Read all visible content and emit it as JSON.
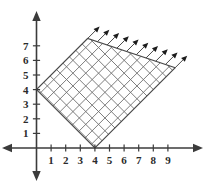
{
  "figure": {
    "kind": "coordinate-graph",
    "background_color": "#ffffff",
    "axis_color": "#3b3b3b",
    "label_color": "#2b2b2b",
    "region_border_color": "#4a4a4a",
    "hatch_color": "#6e6e6e",
    "arrow_color": "#1c1c1c"
  },
  "chart_data": {
    "type": "scatter",
    "title": "",
    "subtitle": "",
    "xlabel": "",
    "ylabel": "",
    "grid": false,
    "legend": "none",
    "xlim": [
      -1,
      10.5
    ],
    "ylim": [
      -1,
      8
    ],
    "x_ticks": [
      1,
      2,
      3,
      4,
      5,
      6,
      7,
      8,
      9
    ],
    "y_ticks": [
      1,
      2,
      3,
      4,
      5,
      6,
      7
    ],
    "x_tick_labels": [
      "1",
      "2",
      "3",
      "4",
      "5",
      "6",
      "7",
      "8",
      "9"
    ],
    "y_tick_labels": [
      "1",
      "2",
      "3",
      "4",
      "5",
      "6",
      "7"
    ],
    "x_axis_arrows": [
      "left",
      "right"
    ],
    "y_axis_arrows": [
      "up",
      "down"
    ],
    "shaded_region": {
      "style": "cross-hatched",
      "shape": "parallelogram-unbounded",
      "boundary_lines": [
        {
          "name": "lower-boundary",
          "slope": 1,
          "intercept": -4,
          "equation": "y = x - 4",
          "through": [
            [
              4,
              0
            ],
            [
              9.5,
              5.5
            ]
          ]
        },
        {
          "name": "upper-boundary",
          "slope": 1,
          "intercept": 4,
          "equation": "y = x + 4",
          "through": [
            [
              0,
              4
            ],
            [
              3.5,
              7.5
            ]
          ]
        }
      ],
      "vertices": [
        [
          0,
          4
        ],
        [
          4,
          0
        ],
        [
          9.5,
          5.5
        ],
        [
          3.5,
          7.5
        ]
      ],
      "y_axis_intercept": [
        0,
        4
      ],
      "x_axis_intercept": [
        4,
        0
      ],
      "hatch_spacing_units": 0.62,
      "hatch_angles_deg": [
        45,
        135
      ],
      "extends_direction": "up-and-right",
      "arrow_count": 10,
      "arrow_angle_deg": 45
    }
  }
}
